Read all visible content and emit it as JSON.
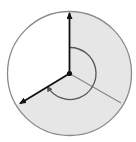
{
  "diagram": {
    "type": "reflex-angle-circle",
    "center": [
      69.5,
      73.5
    ],
    "radius": 62,
    "colors": {
      "background": "#ffffff",
      "shaded_region": "#e6e6e6",
      "circle_outline": "#8a8a8a",
      "arrows": "#111111",
      "divider_line": "#8a8a8a",
      "angle_arc": "#555555"
    },
    "rays": [
      {
        "name": "vertical-ray",
        "end": [
          69.5,
          11
        ],
        "arrow": true
      },
      {
        "name": "lower-left-ray",
        "end": [
          19,
          104
        ],
        "arrow": true
      }
    ],
    "divider": {
      "end": [
        121,
        103
      ]
    },
    "angle_arc": {
      "radius": 26,
      "direction": "clockwise",
      "from": "top",
      "to": "lower-left"
    }
  }
}
